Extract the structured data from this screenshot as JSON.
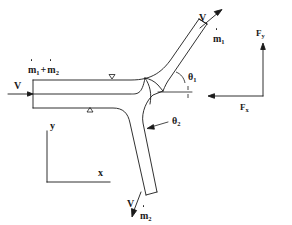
{
  "figure": {
    "type": "engineering-diagram",
    "stroke_color": "#1a1a1a",
    "background_color": "#ffffff"
  },
  "inlet": {
    "velocity_label": "V",
    "mass_flow_label": {
      "m1": "m",
      "m1_sub": "1",
      "operator": "+",
      "m2": "m",
      "m2_sub": "2"
    },
    "arrow_direction": "right"
  },
  "outlet_upper": {
    "velocity_label": "V",
    "mass_flow_symbol": "m",
    "mass_flow_sub": "1",
    "arrow_direction": "up-right"
  },
  "outlet_lower": {
    "velocity_label": "V",
    "mass_flow_symbol": "m",
    "mass_flow_sub": "2",
    "arrow_direction": "down-left"
  },
  "angles": {
    "theta1": {
      "symbol": "θ",
      "sub": "1"
    },
    "theta2": {
      "symbol": "θ",
      "sub": "2"
    }
  },
  "forces": {
    "fy": {
      "symbol": "F",
      "sub": "y",
      "direction": "up"
    },
    "fx": {
      "symbol": "F",
      "sub": "x",
      "direction": "left"
    }
  },
  "axes": {
    "y_label": "y",
    "x_label": "x"
  },
  "control_surface_markers": [
    {
      "name": "marker-top",
      "glyph": "▽"
    },
    {
      "name": "marker-bottom",
      "glyph": "△"
    }
  ]
}
